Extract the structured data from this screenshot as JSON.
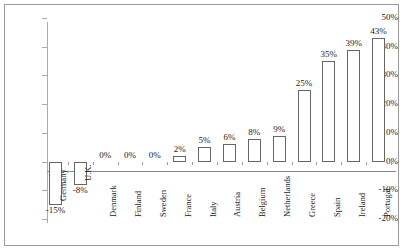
{
  "chart_data": {
    "type": "bar",
    "title": "",
    "subtitle": "",
    "xlabel": "",
    "ylabel": "",
    "ylim": [
      -20,
      50
    ],
    "grid": false,
    "legend": false,
    "legend_position": "none",
    "y_tick_labels": [
      "50%",
      "40%",
      "30%",
      "20%",
      "10%",
      "0%",
      "-10%",
      "-20%"
    ],
    "y_tick_values": [
      50,
      40,
      30,
      20,
      10,
      0,
      -10,
      -20
    ],
    "categories": [
      "Germany",
      "U.K.",
      "Denmark",
      "Finland",
      "Sweden",
      "France",
      "Italy",
      "Austria",
      "Belgium",
      "Netherlands",
      "Greece",
      "Spain",
      "Ireland",
      "Portugal"
    ],
    "values": [
      -15,
      -8,
      0,
      0,
      0,
      2,
      5,
      6,
      8,
      9,
      25,
      35,
      39,
      43
    ],
    "data_labels": [
      "-15%",
      "-8%",
      "0%",
      "0%",
      "0%",
      "2%",
      "5%",
      "6%",
      "8%",
      "9%",
      "25%",
      "35%",
      "39%",
      "43%"
    ],
    "bar_fill_color": "#ffffff",
    "bar_border_color": "#666666",
    "axis_color": "#999999",
    "text_color": "#222222"
  }
}
